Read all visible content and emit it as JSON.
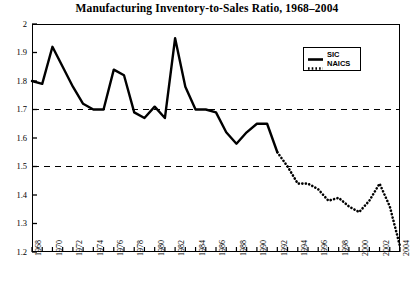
{
  "chart_data": {
    "type": "line",
    "title": "Manufacturing Inventory-to-Sales Ratio, 1968–2004",
    "xlabel": "",
    "ylabel": "",
    "xlim": [
      1968,
      2004
    ],
    "ylim": [
      1.2,
      2.0
    ],
    "grid": "horizontal-dashed-reference-lines",
    "reference_lines": [
      1.7,
      1.5
    ],
    "legend_position": "top-right-inside",
    "ytick_labels": [
      "1.2",
      "1.3",
      "1.4",
      "1.5",
      "1.6",
      "1.7",
      "1.8",
      "1.9",
      "2"
    ],
    "ytick_values": [
      1.2,
      1.3,
      1.4,
      1.5,
      1.6,
      1.7,
      1.8,
      1.9,
      2.0
    ],
    "xtick_labels": [
      "1968",
      "1970",
      "1972",
      "1974",
      "1976",
      "1978",
      "1980",
      "1982",
      "1984",
      "1986",
      "1988",
      "1990",
      "1992",
      "1994",
      "1996",
      "1998",
      "2000",
      "2002",
      "2004"
    ],
    "xtick_values": [
      1968,
      1970,
      1972,
      1974,
      1976,
      1978,
      1980,
      1982,
      1984,
      1986,
      1988,
      1990,
      1992,
      1994,
      1996,
      1998,
      2000,
      2002,
      2004
    ],
    "minor_xticks_every": 1,
    "series": [
      {
        "name": "SIC",
        "style": "solid",
        "color": "#000000",
        "x": [
          1968,
          1969,
          1970,
          1971,
          1972,
          1973,
          1974,
          1975,
          1976,
          1977,
          1978,
          1979,
          1980,
          1981,
          1982,
          1983,
          1984,
          1985,
          1986,
          1987,
          1988,
          1989,
          1990,
          1991,
          1992
        ],
        "values": [
          1.8,
          1.79,
          1.92,
          1.85,
          1.78,
          1.72,
          1.7,
          1.7,
          1.84,
          1.82,
          1.69,
          1.67,
          1.71,
          1.67,
          1.95,
          1.78,
          1.7,
          1.7,
          1.69,
          1.62,
          1.58,
          1.62,
          1.65,
          1.65,
          1.55
        ]
      },
      {
        "name": "NAICS",
        "style": "dotted",
        "color": "#000000",
        "x": [
          1992,
          1993,
          1994,
          1995,
          1996,
          1997,
          1998,
          1999,
          2000,
          2001,
          2002,
          2003,
          2004
        ],
        "values": [
          1.55,
          1.5,
          1.44,
          1.44,
          1.42,
          1.38,
          1.39,
          1.36,
          1.34,
          1.38,
          1.44,
          1.36,
          1.22
        ]
      }
    ]
  },
  "legend": {
    "items": [
      {
        "label": "SIC",
        "style": "solid"
      },
      {
        "label": "NAICS",
        "style": "dotted"
      }
    ]
  }
}
